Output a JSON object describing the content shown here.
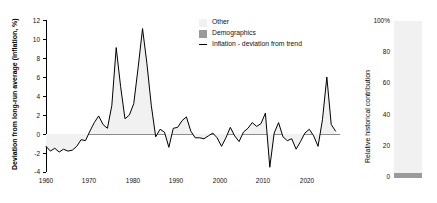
{
  "chart_data": [
    {
      "id": "inflation-deviation",
      "type": "area",
      "title": "",
      "xlabel": "",
      "ylabel": "Deviation from long-run average (inflation, %)",
      "xlim": [
        1958,
        2025
      ],
      "ylim": [
        -4,
        12
      ],
      "xticks": [
        1960,
        1970,
        1980,
        1990,
        2000,
        2010,
        2020
      ],
      "yticks": [
        -4,
        -2,
        0,
        2,
        4,
        6,
        8,
        10,
        12
      ],
      "grid": false,
      "legend_position": "upper-center",
      "zero_line": 0,
      "series": [
        {
          "name": "Inflation - deviation from trend",
          "color": "#000000",
          "fill": "#f1f1f1",
          "x": [
            1958,
            1959,
            1960,
            1961,
            1962,
            1963,
            1964,
            1965,
            1966,
            1967,
            1968,
            1969,
            1970,
            1971,
            1972,
            1973,
            1974,
            1975,
            1976,
            1977,
            1978,
            1979,
            1980,
            1981,
            1982,
            1983,
            1984,
            1985,
            1986,
            1987,
            1988,
            1989,
            1990,
            1991,
            1992,
            1993,
            1994,
            1995,
            1996,
            1997,
            1998,
            1999,
            2000,
            2001,
            2002,
            2003,
            2004,
            2005,
            2006,
            2007,
            2008,
            2009,
            2010,
            2011,
            2012,
            2013,
            2014,
            2015,
            2016,
            2017,
            2018,
            2019,
            2020,
            2021,
            2022,
            2023,
            2024
          ],
          "y": [
            -1.3,
            -1.8,
            -1.5,
            -1.9,
            -1.6,
            -1.8,
            -1.7,
            -1.3,
            -0.6,
            -0.7,
            0.3,
            1.2,
            1.9,
            1.0,
            0.6,
            3.0,
            9.1,
            5.0,
            1.6,
            2.0,
            3.2,
            7.0,
            11.1,
            7.4,
            3.0,
            -0.3,
            0.5,
            0.2,
            -1.4,
            0.6,
            0.7,
            1.4,
            1.8,
            0.3,
            -0.4,
            -0.4,
            -0.5,
            -0.2,
            0.1,
            -0.4,
            -1.3,
            -0.4,
            0.7,
            -0.2,
            -0.8,
            0.2,
            0.6,
            1.2,
            0.8,
            1.1,
            2.2,
            -3.5,
            0.1,
            1.2,
            -0.3,
            -0.7,
            -0.5,
            -1.6,
            -0.8,
            0.1,
            0.5,
            -0.2,
            -1.3,
            1.5,
            6.0,
            1.0,
            0.3
          ]
        }
      ]
    },
    {
      "id": "relative-historical-contribution",
      "type": "bar",
      "stacked": true,
      "title": "",
      "xlabel": "",
      "ylabel": "Relative historical contribution",
      "ylim": [
        0,
        100
      ],
      "yticks": [
        0,
        20,
        40,
        60,
        80,
        100
      ],
      "ytick_labels": [
        "0",
        "20",
        "40",
        "60",
        "80",
        "100%"
      ],
      "categories": [
        ""
      ],
      "grid": false,
      "series": [
        {
          "name": "Other",
          "color": "#f1f1f1",
          "values": [
            96.5
          ]
        },
        {
          "name": "Demographics",
          "color": "#9a9a9a",
          "values": [
            3.5
          ]
        }
      ]
    }
  ],
  "left_panel": {
    "y_axis_title": "Deviation from long-run average (inflation, %)",
    "y_ticks": [
      "12",
      "10",
      "8",
      "6",
      "4",
      "2",
      "0",
      "-2",
      "-4"
    ],
    "x_ticks": [
      "1960",
      "1970",
      "1980",
      "1990",
      "2000",
      "2010",
      "2020"
    ]
  },
  "legend": {
    "items": [
      {
        "label": "Other",
        "marker": "swatch",
        "color": "#f1f1f1"
      },
      {
        "label": "Demographics",
        "marker": "swatch",
        "color": "#9a9a9a"
      },
      {
        "label": "Inflation - deviation from trend",
        "marker": "line",
        "color": "#000000"
      }
    ]
  },
  "right_panel": {
    "y_axis_title": "Relative historical contribution",
    "y_ticks": [
      "100%",
      "80",
      "60",
      "40",
      "20",
      "0"
    ]
  }
}
